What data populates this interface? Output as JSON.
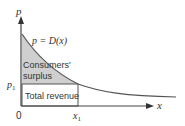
{
  "diagram": {
    "axes": {
      "y_label": "p",
      "x_label": "x",
      "origin_label": "0"
    },
    "curve": {
      "label": "p = D(x)",
      "type": "decreasing convex demand curve"
    },
    "marks": {
      "price_label": "p",
      "price_subscript": "1",
      "quantity_label": "x",
      "quantity_subscript": "1"
    },
    "regions": [
      {
        "id": "consumers-surplus",
        "label_line1": "Consumers'",
        "label_line2": "surplus",
        "fill": "#cfcfcf"
      },
      {
        "id": "total-revenue",
        "label": "Total revenue",
        "fill": "#ffffff"
      }
    ],
    "colors": {
      "line": "#555555",
      "text": "#333333",
      "shade": "#cfcfcf"
    }
  }
}
